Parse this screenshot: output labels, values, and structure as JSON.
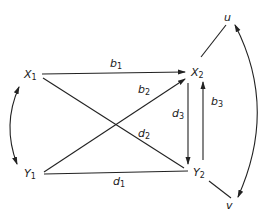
{
  "diagram": {
    "type": "directed-graph",
    "colors": {
      "stroke": "#222222",
      "background": "#ffffff"
    },
    "nodes": [
      {
        "id": "X1",
        "label": "X",
        "sub": "1"
      },
      {
        "id": "Y1",
        "label": "Y",
        "sub": "1"
      },
      {
        "id": "X2",
        "label": "X",
        "sub": "2"
      },
      {
        "id": "Y2",
        "label": "Y",
        "sub": "2"
      },
      {
        "id": "u",
        "label": "u",
        "sub": ""
      },
      {
        "id": "v",
        "label": "v",
        "sub": ""
      }
    ],
    "edges": [
      {
        "from": "X1",
        "to": "X2",
        "label": "b",
        "sub": "1",
        "arrow": "end"
      },
      {
        "from": "Y1",
        "to": "X2",
        "label": "b",
        "sub": "2",
        "arrow": "end"
      },
      {
        "from": "X1",
        "to": "Y2",
        "label": "d",
        "sub": "2",
        "arrow": "none"
      },
      {
        "from": "Y1",
        "to": "Y2",
        "label": "d",
        "sub": "1",
        "arrow": "none"
      },
      {
        "from": "X2",
        "to": "Y2",
        "label": "d",
        "sub": "3",
        "arrow": "end"
      },
      {
        "from": "Y2",
        "to": "X2",
        "label": "b",
        "sub": "3",
        "arrow": "end"
      },
      {
        "from": "X2",
        "to": "u",
        "label": "",
        "sub": "",
        "arrow": "none"
      },
      {
        "from": "Y2",
        "to": "v",
        "label": "",
        "sub": "",
        "arrow": "none"
      },
      {
        "from": "X1",
        "to": "Y1",
        "label": "",
        "sub": "",
        "arrow": "both",
        "curved": true
      },
      {
        "from": "u",
        "to": "v",
        "label": "",
        "sub": "",
        "arrow": "both",
        "curved": true
      }
    ]
  }
}
